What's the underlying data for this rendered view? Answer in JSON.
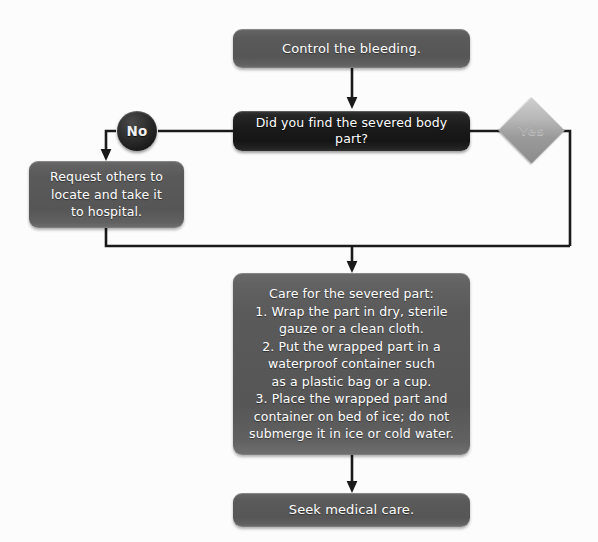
{
  "diagram": {
    "background_color": "#fcfcfc",
    "process_node_color": "#5a5a5a",
    "decision_node_color": "#1b1b1b",
    "badge_no_color": "#222222",
    "badge_yes_color": "#b5b5b5",
    "connector_color": "#1a1a1a",
    "text_color": "#ffffff"
  },
  "nodes": {
    "start": {
      "label": "Control the bleeding.",
      "type": "process"
    },
    "decision": {
      "label": "Did you find the severed body part?",
      "type": "decision"
    },
    "branch_no": {
      "label": "No",
      "type": "badge-circle"
    },
    "branch_yes": {
      "label": "Yes",
      "type": "badge-diamond"
    },
    "request": {
      "label": "Request others to\nlocate and take it\nto hospital.",
      "type": "process"
    },
    "care": {
      "label": "Care for the severed part:\n1. Wrap the part in dry, sterile\ngauze or a clean cloth.\n2. Put the wrapped part in a\nwaterproof container such\nas a plastic bag or a cup.\n3. Place the wrapped part and\ncontainer on bed of ice; do not\nsubmerge it in ice or cold water.",
      "type": "process"
    },
    "end": {
      "label": "Seek medical care.",
      "type": "process"
    }
  }
}
